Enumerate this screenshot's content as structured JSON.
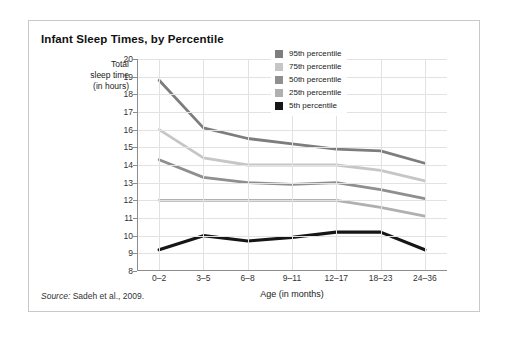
{
  "card": {
    "title": "Infant Sleep Times, by Percentile",
    "source_prefix": "Source:",
    "source_text": "Sadeh et al., 2009."
  },
  "chart_data": {
    "type": "line",
    "title": "Infant Sleep Times, by Percentile",
    "xlabel": "Age (in months)",
    "ylabel": "Total sleep time (in hours)",
    "ylabel_lines": [
      "Total",
      "sleep time",
      "(in hours)"
    ],
    "categories": [
      "0–2",
      "3–5",
      "6–8",
      "9–11",
      "12–17",
      "18–23",
      "24–36"
    ],
    "ylim": [
      8,
      20
    ],
    "yticks": [
      8,
      9,
      10,
      11,
      12,
      13,
      14,
      15,
      16,
      17,
      18,
      19,
      20
    ],
    "grid": true,
    "legend_position": "top-right",
    "series": [
      {
        "name": "95th percentile",
        "color": "#7d7d7d",
        "values": [
          18.8,
          16.1,
          15.5,
          15.2,
          14.9,
          14.8,
          14.1
        ]
      },
      {
        "name": "75th percentile",
        "color": "#c6c6c6",
        "values": [
          16.0,
          14.4,
          14.0,
          14.0,
          14.0,
          13.7,
          13.1
        ]
      },
      {
        "name": "50th percentile",
        "color": "#8f8f8f",
        "values": [
          14.3,
          13.3,
          13.0,
          12.9,
          13.0,
          12.6,
          12.1
        ]
      },
      {
        "name": "25th percentile",
        "color": "#b0b0b0",
        "values": [
          12.0,
          12.0,
          12.0,
          12.0,
          12.0,
          11.6,
          11.1
        ]
      },
      {
        "name": "5th percentile",
        "color": "#161616",
        "values": [
          9.2,
          10.0,
          9.7,
          9.9,
          10.2,
          10.2,
          9.2
        ]
      }
    ]
  }
}
